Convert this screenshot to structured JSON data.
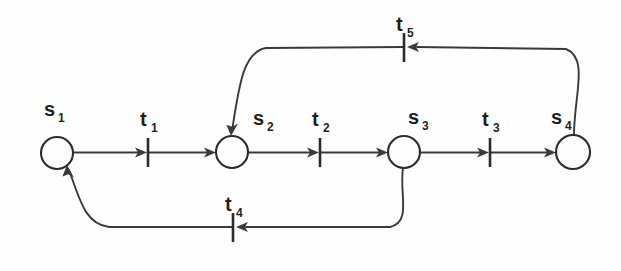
{
  "diagram": {
    "type": "petri-net",
    "background_color": "#fefefe",
    "stroke_color": "#3a3a3a",
    "label_color": "#1f1f1f",
    "places": [
      {
        "id": "s1",
        "base": "s",
        "sub": "1",
        "cx": 57,
        "cy": 153,
        "r": 16,
        "label_x": 44,
        "label_y": 116
      },
      {
        "id": "s2",
        "base": "s",
        "sub": "2",
        "cx": 232,
        "cy": 152,
        "r": 16,
        "label_x": 253,
        "label_y": 125
      },
      {
        "id": "s3",
        "base": "s",
        "sub": "3",
        "cx": 404,
        "cy": 152,
        "r": 16,
        "label_x": 408,
        "label_y": 124
      },
      {
        "id": "s4",
        "base": "s",
        "sub": "4",
        "cx": 573,
        "cy": 152,
        "r": 17,
        "label_x": 551,
        "label_y": 124
      }
    ],
    "transitions": [
      {
        "id": "t1",
        "base": "t",
        "sub": "1",
        "x": 148,
        "y": 152,
        "half_height": 14,
        "label_x": 140,
        "label_y": 126,
        "orientation": "vertical-bar"
      },
      {
        "id": "t2",
        "base": "t",
        "sub": "2",
        "x": 320,
        "y": 152,
        "half_height": 14,
        "label_x": 312,
        "label_y": 126,
        "orientation": "vertical-bar"
      },
      {
        "id": "t3",
        "base": "t",
        "sub": "3",
        "x": 490,
        "y": 152,
        "half_height": 14,
        "label_x": 482,
        "label_y": 126,
        "orientation": "vertical-bar"
      },
      {
        "id": "t4",
        "base": "t",
        "sub": "4",
        "x": 233,
        "y": 227,
        "half_height": 14,
        "label_x": 225,
        "label_y": 211,
        "orientation": "vertical-bar"
      },
      {
        "id": "t5",
        "base": "t",
        "sub": "5",
        "x": 404,
        "y": 47,
        "half_height": 14,
        "label_x": 396,
        "label_y": 31,
        "orientation": "vertical-bar"
      }
    ],
    "arcs": [
      {
        "id": "arc-s1-t1",
        "from": "s1",
        "to": "t1",
        "direction": "right",
        "kind": "straight"
      },
      {
        "id": "arc-t1-s2",
        "from": "t1",
        "to": "s2",
        "direction": "right",
        "kind": "straight"
      },
      {
        "id": "arc-s2-t2",
        "from": "s2",
        "to": "t2",
        "direction": "right",
        "kind": "straight"
      },
      {
        "id": "arc-t2-s3",
        "from": "t2",
        "to": "s3",
        "direction": "right",
        "kind": "straight"
      },
      {
        "id": "arc-s3-t3",
        "from": "s3",
        "to": "t3",
        "direction": "right",
        "kind": "straight"
      },
      {
        "id": "arc-t3-s4",
        "from": "t3",
        "to": "s4",
        "direction": "right",
        "kind": "straight"
      },
      {
        "id": "arc-s4-t5",
        "from": "s4",
        "to": "t5",
        "direction": "left",
        "kind": "curved-top"
      },
      {
        "id": "arc-t5-s2",
        "from": "t5",
        "to": "s2",
        "direction": "left",
        "kind": "curved-top"
      },
      {
        "id": "arc-s3-t4",
        "from": "s3",
        "to": "t4",
        "direction": "left",
        "kind": "curved-bottom"
      },
      {
        "id": "arc-t4-s1",
        "from": "t4",
        "to": "s1",
        "direction": "left",
        "kind": "curved-bottom"
      }
    ]
  }
}
